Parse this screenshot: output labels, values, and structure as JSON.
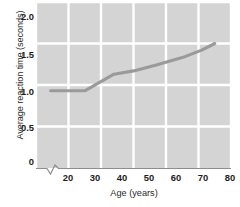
{
  "chart_data": {
    "type": "line",
    "title": "",
    "xlabel": "Age (years)",
    "ylabel": "Average reaction time (seconds)",
    "xlim": [
      20,
      80
    ],
    "ylim": [
      0,
      2.0
    ],
    "xticks": [
      "20",
      "30",
      "40",
      "50",
      "60",
      "70",
      "80"
    ],
    "yticks": [
      "0",
      "0.5",
      "1.0",
      "1.5",
      "2.0"
    ],
    "xtick_values": [
      20,
      30,
      40,
      50,
      60,
      70,
      80
    ],
    "ytick_values": [
      0,
      0.5,
      1.0,
      1.5,
      2.0
    ],
    "grid": true,
    "legend": "none",
    "axis_break": "x-axis break between 0 and 20",
    "plot_background": "#d4d4d4",
    "grid_color": "#ffffff",
    "line_color": "#9a9a9a",
    "series": [
      {
        "name": "Average reaction time",
        "x": [
          24.5,
          35,
          44,
          50,
          57,
          65,
          71,
          75
        ],
        "values": [
          0.93,
          0.93,
          1.13,
          1.17,
          1.24,
          1.33,
          1.42,
          1.5
        ]
      }
    ]
  }
}
